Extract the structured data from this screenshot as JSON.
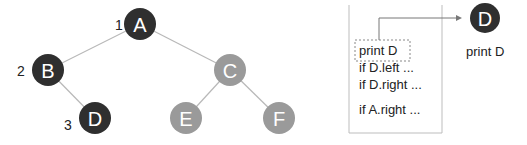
{
  "colors": {
    "visited": "#2f2f2f",
    "unvisited": "#9a9a9a",
    "edge": "#b8b8b8",
    "text": "#222222"
  },
  "tree": {
    "nodes": [
      {
        "id": "A",
        "label": "A",
        "x": 140,
        "y": 24,
        "order": "1",
        "visited": true
      },
      {
        "id": "B",
        "label": "B",
        "x": 48,
        "y": 70,
        "order": "2",
        "visited": true
      },
      {
        "id": "D",
        "label": "D",
        "x": 95,
        "y": 118,
        "order": "3",
        "visited": true
      },
      {
        "id": "C",
        "label": "C",
        "x": 230,
        "y": 70,
        "order": "",
        "visited": false
      },
      {
        "id": "E",
        "label": "E",
        "x": 186,
        "y": 118,
        "order": "",
        "visited": false
      },
      {
        "id": "F",
        "label": "F",
        "x": 279,
        "y": 118,
        "order": "",
        "visited": false
      }
    ],
    "edges": [
      [
        "A",
        "B"
      ],
      [
        "A",
        "C"
      ],
      [
        "B",
        "D"
      ],
      [
        "C",
        "E"
      ],
      [
        "C",
        "F"
      ]
    ]
  },
  "stack_frame": {
    "lines": [
      "print D",
      "if D.left ...",
      "if D.right ...",
      "if A.right ..."
    ],
    "highlighted_line": "print D"
  },
  "output": {
    "node_label": "D",
    "caption": "print D"
  }
}
